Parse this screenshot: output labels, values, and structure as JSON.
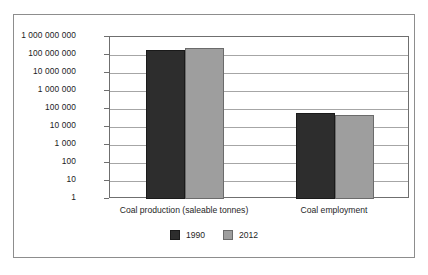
{
  "chart_data": {
    "type": "bar",
    "title": "",
    "subtitle": "",
    "xlabel": "",
    "ylabel": "",
    "scale": "log10",
    "ylim": [
      1,
      1000000000
    ],
    "grid": true,
    "legend_position": "bottom-center",
    "categories": [
      "Coal production (saleable tonnes)",
      "Coal employment"
    ],
    "ytick_labels": [
      "1 000 000 000",
      "100 000 000",
      "10 000 000",
      "1 000 000",
      "100 000",
      "10 000",
      "1 000",
      "100",
      "10",
      "1"
    ],
    "ytick_values": [
      1000000000,
      100000000,
      10000000,
      1000000,
      100000,
      10000,
      1000,
      100,
      10,
      1
    ],
    "series": [
      {
        "name": "1990",
        "color": "#2d2d2d",
        "values": [
          190000000,
          60000
        ]
      },
      {
        "name": "2012",
        "color": "#9e9e9e",
        "values": [
          260000000,
          45000
        ]
      }
    ]
  },
  "legend": {
    "items": [
      {
        "label": "1990",
        "swatch": "legend-swatch-dark"
      },
      {
        "label": "2012",
        "swatch": "legend-swatch-gray"
      }
    ]
  }
}
